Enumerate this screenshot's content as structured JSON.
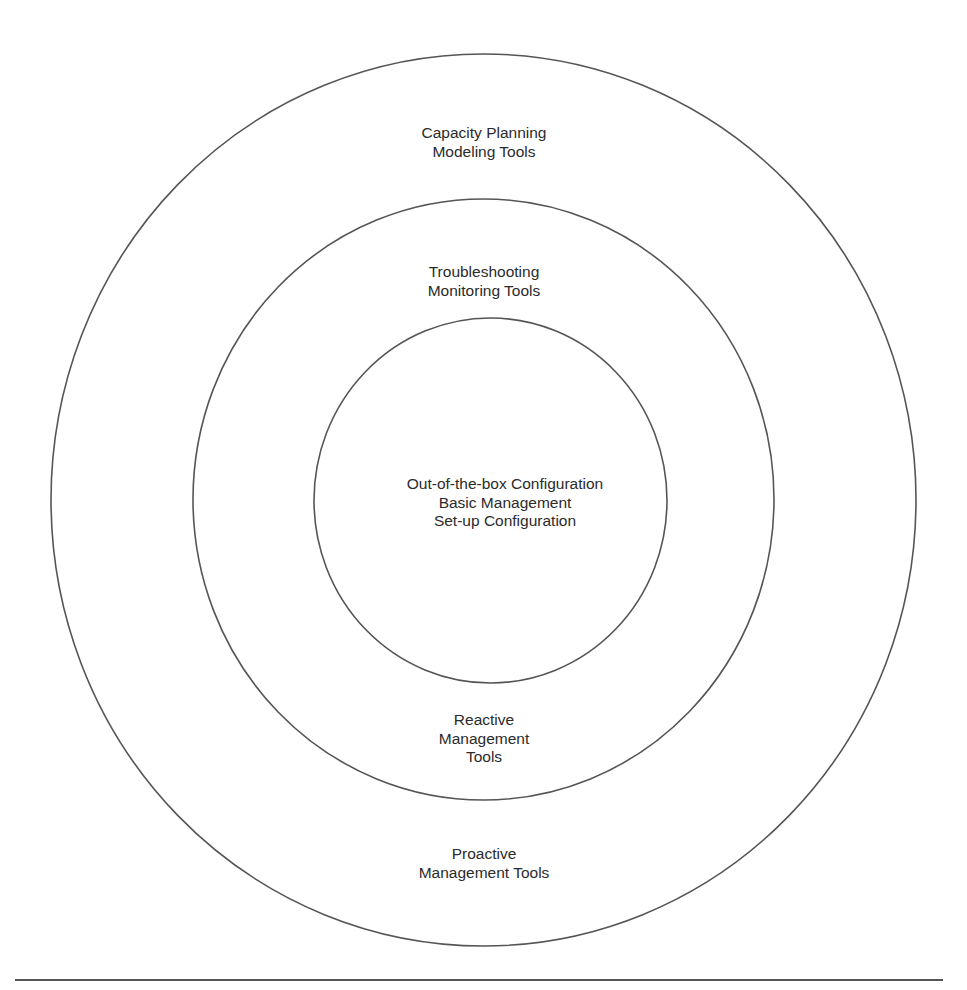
{
  "diagram": {
    "type": "concentric-circles",
    "colors": {
      "stroke": "#555555",
      "text": "#2b2b2b",
      "background": "#ffffff"
    },
    "rings": [
      {
        "id": "outer",
        "top_label": [
          "Capacity Planning",
          "Modeling Tools"
        ],
        "bottom_label": [
          "Proactive",
          "Management Tools"
        ]
      },
      {
        "id": "middle",
        "top_label": [
          "Troubleshooting",
          "Monitoring Tools"
        ],
        "bottom_label": [
          "Reactive",
          "Management",
          "Tools"
        ]
      },
      {
        "id": "inner",
        "center_label": [
          "Out-of-the-box Configuration",
          "Basic Management",
          "Set-up Configuration"
        ]
      }
    ]
  }
}
